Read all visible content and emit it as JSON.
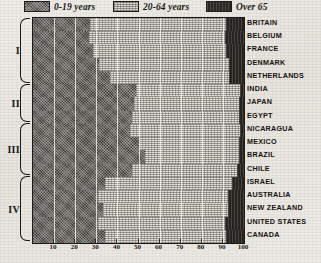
{
  "legend": {
    "items": [
      {
        "label": "0-19 years",
        "swatch": "young-swatch",
        "color": "#45423d"
      },
      {
        "label": "20-64 years",
        "swatch": "mid-swatch",
        "color": "#e2dfd8"
      },
      {
        "label": "Over 65",
        "swatch": "old-swatch",
        "color": "#262421"
      }
    ]
  },
  "groups": [
    {
      "numeral": "I",
      "count": 5
    },
    {
      "numeral": "II",
      "count": 3
    },
    {
      "numeral": "III",
      "count": 4
    },
    {
      "numeral": "IV",
      "count": 5
    }
  ],
  "axis": {
    "ticks": [
      "10",
      "20",
      "30",
      "40",
      "50",
      "60",
      "70",
      "80",
      "90",
      "100"
    ],
    "min": 0,
    "max": 100
  },
  "chart_data": {
    "type": "bar",
    "orientation": "horizontal",
    "stacked": true,
    "title": "",
    "xlabel": "",
    "ylabel": "",
    "xlim": [
      0,
      100
    ],
    "grid": true,
    "legend_position": "top",
    "categories": [
      "BRITAIN",
      "BELGIUM",
      "FRANCE",
      "DENMARK",
      "NETHERLANDS",
      "INDIA",
      "JAPAN",
      "EGYPT",
      "NICARAGUA",
      "MEXICO",
      "BRAZIL",
      "CHILE",
      "ISRAEL",
      "AUSTRALIA",
      "NEW ZEALAND",
      "UNITED STATES",
      "CANADA"
    ],
    "series": [
      {
        "name": "0-19 years",
        "values": [
          27,
          26.5,
          28.5,
          31.5,
          36.5,
          49,
          48,
          47,
          46,
          50,
          53,
          47,
          34,
          31,
          33,
          31,
          34
        ]
      },
      {
        "name": "20-64 years",
        "values": [
          64.5,
          64.5,
          63,
          61.5,
          56.5,
          49,
          49.5,
          50.5,
          52,
          47.5,
          44.5,
          49.5,
          60.5,
          61.5,
          59.5,
          60,
          57.5
        ]
      },
      {
        "name": "Over 65",
        "values": [
          8.5,
          9,
          8.5,
          7,
          7,
          2,
          2.5,
          2.5,
          2,
          2.5,
          2.5,
          3.5,
          5.5,
          7.5,
          7.5,
          9,
          8.5
        ]
      }
    ]
  }
}
